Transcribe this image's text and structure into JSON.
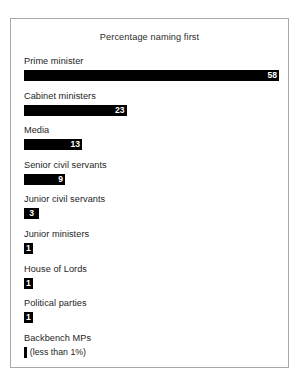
{
  "chart_data": {
    "type": "bar",
    "title": "Percentage naming first",
    "xlabel": "",
    "ylabel": "",
    "orientation": "horizontal",
    "grid": false,
    "legend": false,
    "xlim": [
      0,
      58
    ],
    "units": "percent",
    "categories": [
      "Prime minister",
      "Cabinet ministers",
      "Media",
      "Senior civil servants",
      "Junior civil servants",
      "Junior ministers",
      "House of Lords",
      "Political parties",
      "Backbench MPs"
    ],
    "values": [
      58,
      23,
      13,
      9,
      3,
      1,
      1,
      1,
      0.4
    ],
    "value_labels": [
      "58",
      "23",
      "13",
      "9",
      "3",
      "1",
      "1",
      "1",
      ""
    ],
    "annotations": [
      {
        "category": "Backbench MPs",
        "text": "(less than 1%)"
      }
    ]
  },
  "colors": {
    "bar": "#000000",
    "value_text": "#ffffff",
    "label_text": "#1e1e1e",
    "frame": "#a8a8a8",
    "background": "#ffffff"
  },
  "rows": [
    {
      "label": "Prime minister",
      "value_label": "58",
      "bar_width_pct": 100.0,
      "note": ""
    },
    {
      "label": "Cabinet ministers",
      "value_label": "23",
      "bar_width_pct": 40.2,
      "note": ""
    },
    {
      "label": "Media",
      "value_label": "13",
      "bar_width_pct": 22.8,
      "note": ""
    },
    {
      "label": "Senior civil servants",
      "value_label": "9",
      "bar_width_pct": 16.1,
      "note": ""
    },
    {
      "label": "Junior civil servants",
      "value_label": "3",
      "bar_width_pct": 5.9,
      "note": ""
    },
    {
      "label": "Junior ministers",
      "value_label": "1",
      "bar_width_pct": 3.5,
      "note": ""
    },
    {
      "label": "House of Lords",
      "value_label": "1",
      "bar_width_pct": 3.5,
      "note": ""
    },
    {
      "label": "Political parties",
      "value_label": "1",
      "bar_width_pct": 3.5,
      "note": ""
    },
    {
      "label": "Backbench MPs",
      "value_label": "",
      "bar_width_pct": 1.1,
      "note": "(less than 1%)"
    }
  ]
}
